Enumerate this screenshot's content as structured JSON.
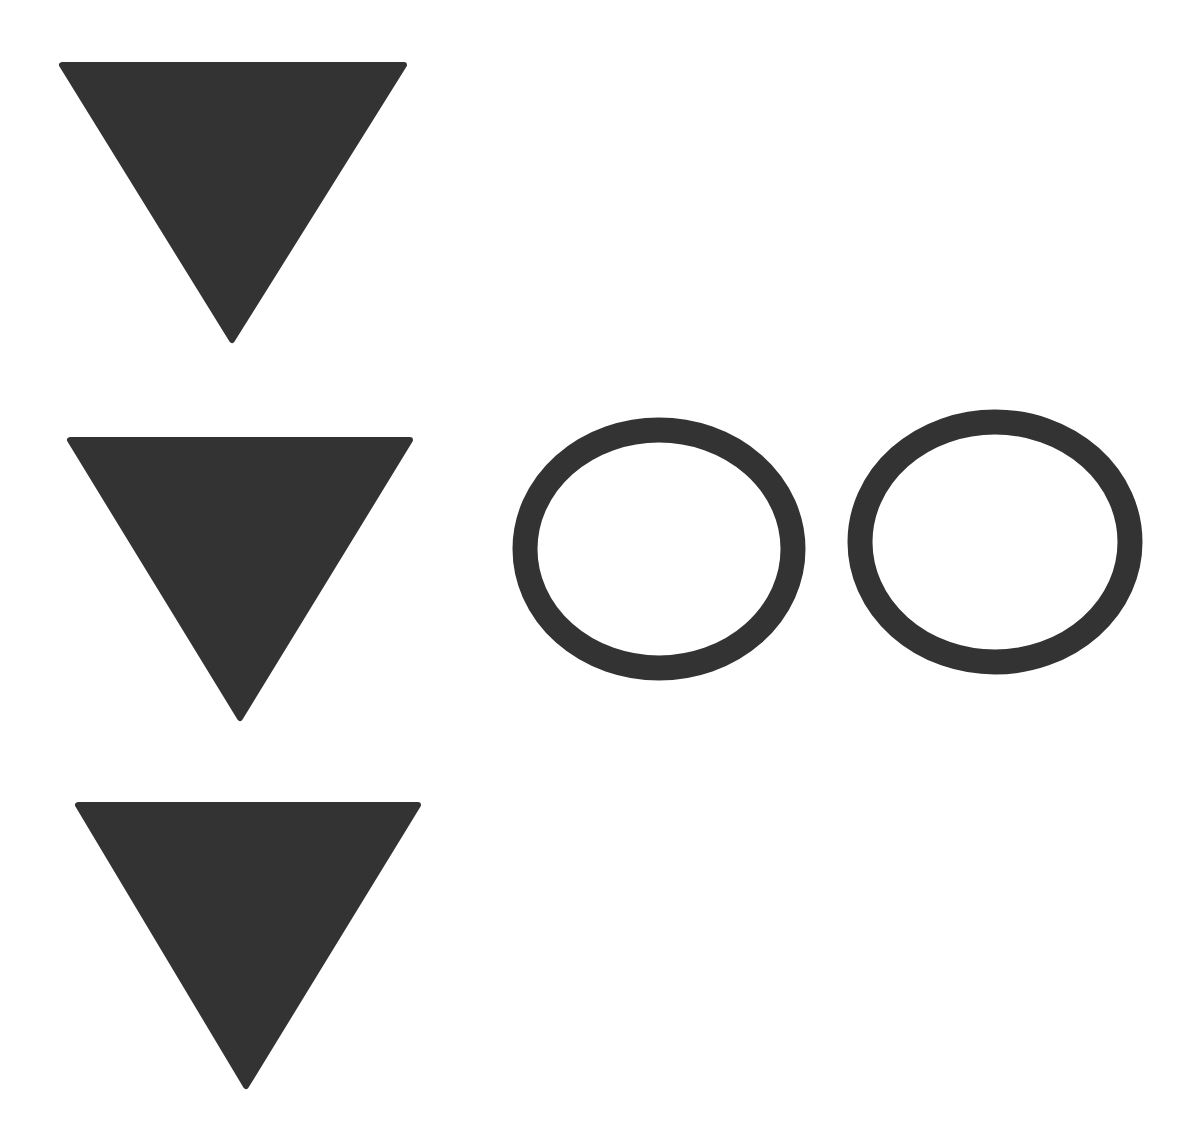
{
  "canvas": {
    "width": 1198,
    "height": 1134,
    "background": "#ffffff"
  },
  "colors": {
    "shape_fill": "#333333"
  },
  "shapes": {
    "triangles": [
      {
        "id": "triangle-1",
        "type": "inverted-triangle",
        "points": "62,65 404,65 232,340"
      },
      {
        "id": "triangle-2",
        "type": "inverted-triangle",
        "points": "70,440 410,440 240,718"
      },
      {
        "id": "triangle-3",
        "type": "inverted-triangle",
        "points": "78,805 418,805 246,1086"
      }
    ],
    "rings": [
      {
        "id": "ring-1",
        "type": "ring",
        "cx": 659,
        "cy": 549,
        "rx": 134,
        "ry": 119,
        "stroke_width": 25
      },
      {
        "id": "ring-2",
        "type": "ring",
        "cx": 995,
        "cy": 542,
        "rx": 135,
        "ry": 120,
        "stroke_width": 25
      }
    ]
  },
  "summary": {
    "triangle_count": 3,
    "ring_count": 2
  }
}
